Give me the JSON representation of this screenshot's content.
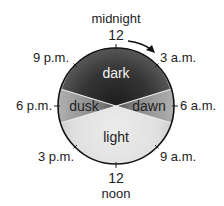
{
  "diagram": {
    "top_label": "midnight",
    "top_number": "12",
    "bottom_number": "12",
    "bottom_label": "noon",
    "times": {
      "t9pm": "9 p.m.",
      "t3am": "3 a.m.",
      "t6pm": "6 p.m.",
      "t6am": "6 a.m.",
      "t3pm": "3 p.m.",
      "t9am": "9 a.m."
    },
    "sectors": {
      "dark": "dark",
      "dusk": "dusk",
      "dawn": "dawn",
      "light": "light"
    },
    "colors": {
      "dark": "#2a2a2a",
      "dusk_dawn": "#8a8a8a",
      "light": "#e4e4e4",
      "outline": "#111111"
    },
    "direction_arrow": "clockwise"
  }
}
